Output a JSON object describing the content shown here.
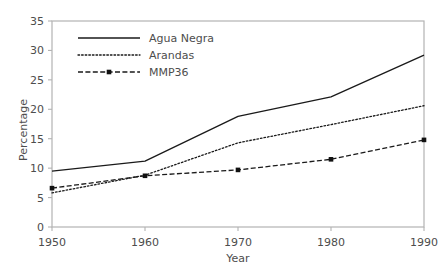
{
  "chart_data": {
    "type": "line",
    "title": "",
    "xlabel": "Year",
    "ylabel": "Percentage",
    "x": [
      1950,
      1960,
      1970,
      1980,
      1990
    ],
    "xticklabels": [
      "1950",
      "1960",
      "1970",
      "1980",
      "1990"
    ],
    "yticklabels": [
      "0",
      "5",
      "10",
      "15",
      "20",
      "25",
      "30",
      "35"
    ],
    "yticks": [
      0,
      5,
      10,
      15,
      20,
      25,
      30,
      35
    ],
    "xlim": [
      1950,
      1990
    ],
    "ylim": [
      0,
      35
    ],
    "grid": false,
    "legend_position": "upper-left-inside",
    "series": [
      {
        "name": "Agua Negra",
        "style": "solid",
        "color": "#1a1a1a",
        "marker": "none",
        "values": [
          9.5,
          11.2,
          18.8,
          22.1,
          29.2
        ]
      },
      {
        "name": "Arandas",
        "style": "dotted",
        "color": "#1a1a1a",
        "marker": "none",
        "values": [
          5.8,
          8.8,
          14.3,
          17.4,
          20.6
        ]
      },
      {
        "name": "MMP36",
        "style": "dash-dot",
        "color": "#1a1a1a",
        "marker": "square",
        "values": [
          6.6,
          8.7,
          9.7,
          11.5,
          14.8
        ]
      }
    ]
  },
  "axes": {
    "frame_color": "#b3b3b3",
    "text_color": "#4d4d4d",
    "background": "#ffffff"
  },
  "legend": {
    "entries": [
      {
        "label": "Agua Negra",
        "style": "solid"
      },
      {
        "label": "Arandas",
        "style": "dotted"
      },
      {
        "label": "MMP36",
        "style": "dash-dot"
      }
    ]
  }
}
